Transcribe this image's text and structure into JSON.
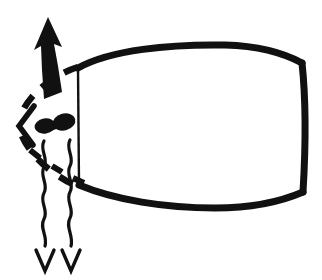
{
  "figure": {
    "title": "Diagram of a barrel-shaped body with a dashed head outline, an upward arrow, and two wavy downward arrows",
    "background_color": "#ffffff",
    "ink_color": "#111111",
    "width": 322,
    "height": 280
  },
  "elements": {
    "body_shape": {
      "name": "barrel-outline",
      "description": "Large barrel / cask shaped closed outline occupying the right portion",
      "stroke_color": "#111111",
      "stroke_width_top": 6,
      "stroke_width_left": 2,
      "bounds": {
        "x": 76,
        "y": 52,
        "width": 230,
        "height": 155
      }
    },
    "head_outline": {
      "name": "dashed-head-curve",
      "description": "Dashed teardrop curve forming the head, open toward the barrel",
      "stroke_color": "#111111",
      "stroke_width": 6,
      "dash_pattern": "14 11"
    },
    "chevron": {
      "name": "beak-chevron",
      "description": "Thick less-than shaped chevron at the left of the head",
      "stroke_color": "#111111",
      "stroke_width": 5
    },
    "eye": {
      "name": "bowtie-eye",
      "description": "Filled bowtie / dumbbell blob inside the head",
      "fill_color": "#111111"
    },
    "up_arrow": {
      "name": "upward-arrow",
      "description": "Solid tapering arrow pointing up from the head",
      "fill_color": "#111111",
      "direction": "up",
      "tip": {
        "x": 48,
        "y": 17
      }
    },
    "wavy_arrows": {
      "name": "wavy-down-arrows",
      "description": "Two wavy vertical lines ending in small downward arrowheads",
      "stroke_color": "#111111",
      "stroke_width": 3,
      "count": 2,
      "direction": "down",
      "tips": [
        {
          "x": 45,
          "y": 271
        },
        {
          "x": 71,
          "y": 271
        }
      ]
    }
  },
  "labels": {
    "figure_alt": "Black and white line art illustration"
  }
}
